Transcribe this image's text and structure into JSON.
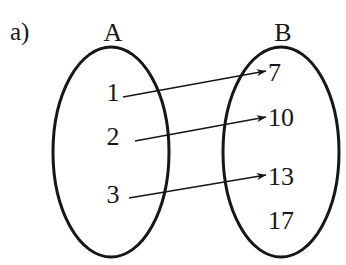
{
  "figure": {
    "part_label": "a)",
    "background_color": "#ffffff",
    "ink_color": "#161616",
    "stroke_width_ellipse": 3,
    "stroke_width_arrow": 1.6
  },
  "sets": [
    {
      "id": "A",
      "label": "A",
      "label_x": 113,
      "label_y": 33,
      "ellipse": {
        "cx": 111,
        "cy": 152,
        "rx": 58,
        "ry": 105
      },
      "elements": [
        {
          "value": "1",
          "x": 113,
          "y": 93
        },
        {
          "value": "2",
          "x": 113,
          "y": 137
        },
        {
          "value": "3",
          "x": 113,
          "y": 195
        }
      ]
    },
    {
      "id": "B",
      "label": "B",
      "label_x": 283,
      "label_y": 33,
      "ellipse": {
        "cx": 281,
        "cy": 152,
        "rx": 58,
        "ry": 105
      },
      "elements": [
        {
          "value": "7",
          "x": 268,
          "y": 73
        },
        {
          "value": "10",
          "x": 268,
          "y": 118
        },
        {
          "value": "13",
          "x": 268,
          "y": 177
        },
        {
          "value": "17",
          "x": 268,
          "y": 221
        }
      ]
    }
  ],
  "mappings": [
    {
      "from": "1",
      "to": "7",
      "x1": 123,
      "y1": 97,
      "x2": 266,
      "y2": 71
    },
    {
      "from": "2",
      "to": "10",
      "x1": 135,
      "y1": 141,
      "x2": 266,
      "y2": 117
    },
    {
      "from": "3",
      "to": "13",
      "x1": 129,
      "y1": 198,
      "x2": 266,
      "y2": 175
    }
  ],
  "unmapped": [
    {
      "set": "B",
      "value": "17"
    }
  ]
}
